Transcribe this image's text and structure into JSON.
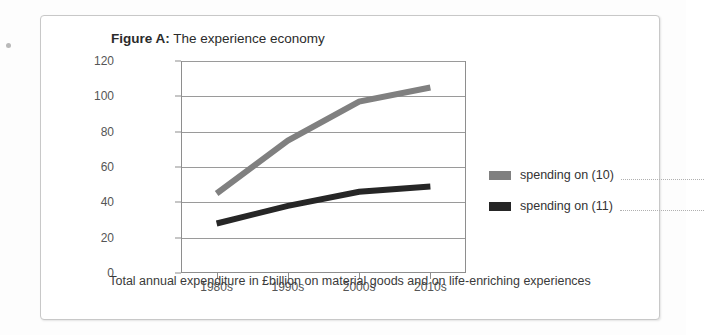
{
  "figure": {
    "label": "Figure A:",
    "title": " The experience economy"
  },
  "caption": "Total annual expenditure in £billion on material goods and on life-enriching experiences",
  "legend": [
    {
      "label": "spending on (10)",
      "color": "#808080",
      "blank": ""
    },
    {
      "label": "spending on (11)",
      "color": "#262626",
      "blank": ""
    }
  ],
  "chart_data": {
    "type": "line",
    "title": "The experience economy",
    "xlabel": "",
    "ylabel": "",
    "categories": [
      "1980s",
      "1990s",
      "2000s",
      "2010s"
    ],
    "yticks": [
      0,
      20,
      40,
      60,
      80,
      100,
      120
    ],
    "ylim": [
      0,
      120
    ],
    "grid": true,
    "legend_position": "right",
    "series": [
      {
        "name": "spending on (10)",
        "color": "#808080",
        "values": [
          45,
          75,
          97,
          105
        ]
      },
      {
        "name": "spending on (11)",
        "color": "#262626",
        "values": [
          28,
          38,
          46,
          49
        ]
      }
    ]
  }
}
